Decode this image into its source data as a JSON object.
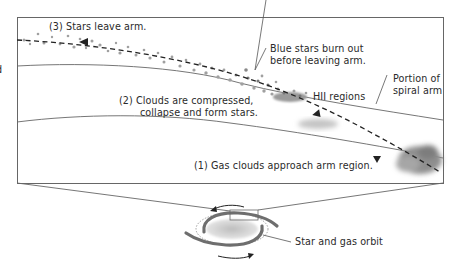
{
  "diagram": {
    "type": "spiral-arm-star-formation",
    "edge_fragment": "d",
    "labels": {
      "step3": "(3)  Stars leave arm.",
      "blue_stars_line1": "Blue stars burn out",
      "blue_stars_line2": "before leaving arm.",
      "spiral_arm_line1": "Portion of",
      "spiral_arm_line2": "spiral arm",
      "step2_line1": "(2)  Clouds are compressed,",
      "step2_line2": "collapse and form stars.",
      "hii": "HII regions",
      "step1": "(1)  Gas clouds approach arm region.",
      "orbit": "Star and gas orbit"
    },
    "colors": {
      "line": "#555555",
      "frame": "#666666",
      "cloud": "#8a8a8a",
      "star_dot": "#9a9a9a",
      "arm": "#6e6e6e",
      "background": "#ffffff"
    }
  }
}
